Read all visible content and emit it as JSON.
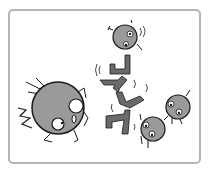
{
  "scene": {
    "description": "Cartoon illustration of round gray creatures and a falling zig-zag chain of bracket shapes",
    "colors": {
      "frame": "#b4b4b4",
      "ball_fill": "#9a9a9a",
      "bracket_fill": "#6a6a6a",
      "outline": "#1a1a1a",
      "eye_white": "#ffffff"
    },
    "characters": [
      {
        "id": "big-ball",
        "cx": 58,
        "cy": 108,
        "r": 26
      },
      {
        "id": "top-ball",
        "cx": 125,
        "cy": 37,
        "r": 12
      },
      {
        "id": "bottom-ball",
        "cx": 153,
        "cy": 129,
        "r": 12
      },
      {
        "id": "right-ball",
        "cx": 178,
        "cy": 107,
        "r": 12
      }
    ]
  }
}
